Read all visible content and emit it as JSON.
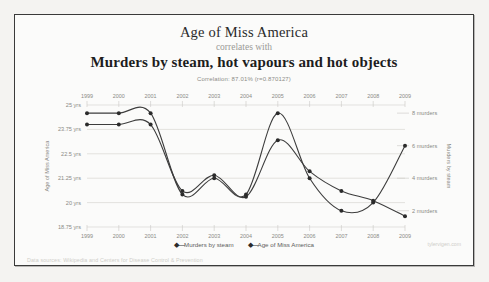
{
  "header": {
    "title_main": "Age of Miss America",
    "connector": "correlates with",
    "title_sub": "Murders by steam, hot vapours and hot objects",
    "correlation": "Correlation: 87.01% (r=0.870127)"
  },
  "footer": {
    "sources": "Data sources: Wikipedia and Centers for Disease Control & Prevention",
    "watermark": "tylervigen.com"
  },
  "legend": {
    "position": "bottom-center",
    "items": [
      {
        "label": "Murders by steam",
        "marker": "diamond",
        "color": "#2b2b2b"
      },
      {
        "label": "Age of Miss America",
        "marker": "diamond",
        "color": "#2b2b2b"
      }
    ]
  },
  "chart_data": {
    "type": "line",
    "title": "Age of Miss America correlates with Murders by steam, hot vapours and hot objects",
    "subtitle": "Correlation: 87.01% (r=0.870127)",
    "xlabel": "",
    "x": [
      "1999",
      "2000",
      "2001",
      "2002",
      "2003",
      "2004",
      "2005",
      "2006",
      "2007",
      "2008",
      "2009"
    ],
    "x_axis_top_ticks": [
      "1999",
      "2000",
      "2001",
      "2002",
      "2003",
      "2004",
      "2005",
      "2006",
      "2007",
      "2008",
      "2009"
    ],
    "x_axis_bottom_ticks": [
      "1999",
      "2000",
      "2001",
      "2002",
      "2003",
      "2004",
      "2005",
      "2006",
      "2007",
      "2008",
      "2009"
    ],
    "grid": true,
    "legend_position": "bottom",
    "axes": [
      {
        "side": "left",
        "label": "Age of Miss America",
        "ticks": [
          "25 yrs",
          "23.75 yrs",
          "22.5 yrs",
          "21.25 yrs",
          "20 yrs",
          "18.75 yrs"
        ],
        "tick_values": [
          25,
          23.75,
          22.5,
          21.25,
          20,
          18.75
        ],
        "range": [
          18.75,
          25
        ]
      },
      {
        "side": "right",
        "label": "Murders by steam",
        "ticks": [
          "8 murders",
          "6 murders",
          "4 murders",
          "2 murders"
        ],
        "tick_values": [
          8,
          6,
          4,
          2
        ],
        "range": [
          1,
          8.5
        ]
      }
    ],
    "series": [
      {
        "name": "Murders by steam",
        "axis": "right",
        "unit": "murders",
        "values": [
          8,
          8,
          8,
          3,
          4,
          3,
          8,
          4,
          2,
          2.5,
          6
        ]
      },
      {
        "name": "Age of Miss America",
        "axis": "left",
        "unit": "yrs",
        "values": [
          24,
          24,
          24,
          20.6,
          21.4,
          20.3,
          23.2,
          21.6,
          20.6,
          20.1,
          19.3
        ]
      }
    ]
  }
}
